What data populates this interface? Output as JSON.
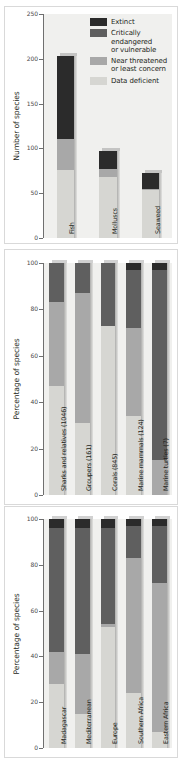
{
  "colors": {
    "extinct": "#2b2b2b",
    "critical": "#5f5f5f",
    "near_threatened": "#a8a8a8",
    "data_deficient": "#d6d6d2",
    "plot_bg": "#f0f0ee",
    "axis": "#6f6f6f",
    "text": "#231f20"
  },
  "legend": {
    "title": "",
    "items": [
      {
        "label": "Extinct",
        "color_key": "extinct"
      },
      {
        "label": "Critically\nendangered\nor vulnerable",
        "color_key": "critical"
      },
      {
        "label": "Near threatened\nor least concern",
        "color_key": "near_threatened"
      },
      {
        "label": "Data deficient",
        "color_key": "data_deficient"
      }
    ]
  },
  "chart_data": [
    {
      "id": "panel-a",
      "type": "bar",
      "stacked": true,
      "title": "",
      "xlabel": "",
      "ylabel": "Number of species",
      "ylim": [
        0,
        250
      ],
      "yticks": [
        0,
        50,
        100,
        150,
        200,
        250
      ],
      "ytick_labels": [
        "0",
        "50",
        "100",
        "150",
        "200",
        "250"
      ],
      "grid": false,
      "legend_position": "top-right",
      "categories": [
        "Fish",
        "Molluscs",
        "Seaweed"
      ],
      "series": [
        {
          "name": "Data deficient",
          "color_key": "data_deficient",
          "values": [
            76,
            68,
            54
          ]
        },
        {
          "name": "Near threatened or least concern",
          "color_key": "near_threatened",
          "values": [
            34,
            9,
            1
          ]
        },
        {
          "name": "Critically endangered or vulnerable",
          "color_key": "critical",
          "values": [
            0,
            0,
            0
          ]
        },
        {
          "name": "Extinct",
          "color_key": "extinct",
          "values": [
            93,
            20,
            18
          ]
        }
      ],
      "totals": [
        203,
        97,
        73
      ]
    },
    {
      "id": "panel-b",
      "type": "bar",
      "stacked": true,
      "title": "",
      "xlabel": "",
      "ylabel": "Percentage of species",
      "ylim": [
        0,
        100
      ],
      "yticks": [
        0,
        20,
        40,
        60,
        80,
        100
      ],
      "ytick_labels": [
        "0",
        "20",
        "40",
        "60",
        "80",
        "100"
      ],
      "grid": false,
      "legend_position": "none",
      "categories": [
        "Sharks and relatives (1046)",
        "Groupers (161)",
        "Corals (845)",
        "Marine mammals (124)",
        "Marine turtles (7)"
      ],
      "series": [
        {
          "name": "Data deficient",
          "color_key": "data_deficient",
          "values": [
            47,
            31,
            73,
            34,
            0
          ]
        },
        {
          "name": "Near threatened or least concern",
          "color_key": "near_threatened",
          "values": [
            36,
            56,
            0,
            38,
            15
          ]
        },
        {
          "name": "Critically endangered or vulnerable",
          "color_key": "critical",
          "values": [
            17,
            13,
            27,
            25,
            82
          ]
        },
        {
          "name": "Extinct",
          "color_key": "extinct",
          "values": [
            0,
            0,
            0,
            3,
            3
          ]
        }
      ],
      "totals": [
        100,
        100,
        100,
        100,
        100
      ]
    },
    {
      "id": "panel-c",
      "type": "bar",
      "stacked": true,
      "title": "",
      "xlabel": "",
      "ylabel": "Percentage of species",
      "ylim": [
        0,
        100
      ],
      "yticks": [
        0,
        20,
        40,
        60,
        80,
        100
      ],
      "ytick_labels": [
        "0",
        "20",
        "40",
        "60",
        "80",
        "100"
      ],
      "grid": false,
      "legend_position": "none",
      "categories": [
        "Madagascar",
        "Mediterranean",
        "Europe",
        "Southern Africa",
        "Eastern Africa"
      ],
      "series": [
        {
          "name": "Data deficient",
          "color_key": "data_deficient",
          "values": [
            28,
            15,
            53,
            24,
            7
          ]
        },
        {
          "name": "Near threatened or least concern",
          "color_key": "near_threatened",
          "values": [
            14,
            26,
            1,
            59,
            65
          ]
        },
        {
          "name": "Critically endangered or vulnerable",
          "color_key": "critical",
          "values": [
            54,
            55,
            42,
            14,
            25
          ]
        },
        {
          "name": "Extinct",
          "color_key": "extinct",
          "values": [
            4,
            4,
            4,
            3,
            3
          ]
        }
      ],
      "totals": [
        100,
        100,
        100,
        100,
        100
      ]
    }
  ]
}
